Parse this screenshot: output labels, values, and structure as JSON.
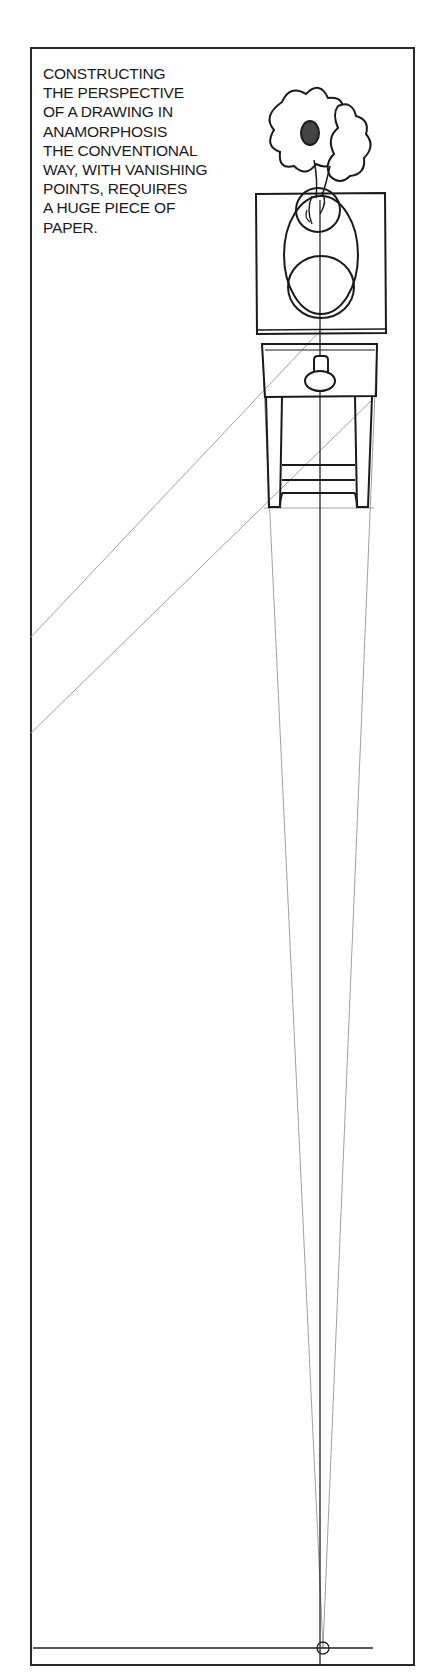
{
  "caption": {
    "lines": [
      "CONSTRUCTING",
      "THE PERSPECTIVE",
      "OF A DRAWING IN",
      "ANAMORPHOSIS",
      "THE CONVENTIONAL",
      "WAY, WITH VANISHING",
      "POINTS, REQUIRES",
      "A HUGE PIECE OF",
      "PAPER."
    ]
  },
  "illustration": {
    "subject": "flower vase on side table viewed in anamorphic perspective",
    "elements": [
      "flowers",
      "round vase",
      "table top",
      "drawer with knob",
      "table legs",
      "stretcher rails"
    ]
  },
  "construction": {
    "vanishing_point_label": "",
    "line_color": "#9a9a9a",
    "ink_color": "#1a1a1a"
  }
}
